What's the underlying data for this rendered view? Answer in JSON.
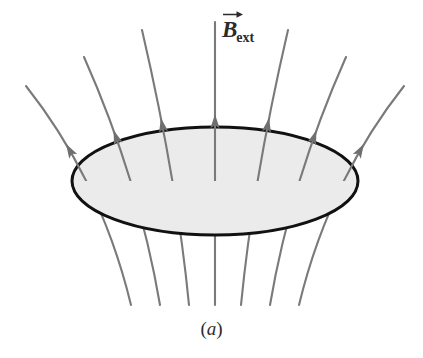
{
  "figure": {
    "caption": "(a)",
    "caption_letter": "a",
    "field_label": {
      "symbol": "B",
      "subscript": "ext",
      "full_text": "B_ext",
      "description": "external magnetic field vector"
    },
    "colors": {
      "background": "#ffffff",
      "line": "#7a7a7a",
      "arrowhead": "#6f6f6f",
      "surface_fill": "#ebebeb",
      "surface_stroke": "#111111",
      "text": "#2b2b2b"
    }
  },
  "diagram_data": {
    "type": "vector-field",
    "title": "Magnetic field lines passing upward through a tilted circular surface",
    "surface": {
      "name": "circular-loop-surface",
      "shape": "ellipse",
      "center_x": 215,
      "center_y": 181,
      "radius_x": 143,
      "radius_y": 54,
      "fill": "#ebebeb",
      "stroke": "#111111",
      "stroke_width": 3,
      "note": "represents a flat circular area viewed in perspective"
    },
    "field_direction": "upward",
    "line_count": 7,
    "arrowheads_shown": 7,
    "lines": [
      {
        "id": "line-1",
        "top_x": 26,
        "top_y": 86,
        "surface_x": 101,
        "bottom_x": 131,
        "bottom_y": 305,
        "arrow_t": 0.33,
        "splay": "far-left"
      },
      {
        "id": "line-2",
        "top_x": 84,
        "top_y": 57,
        "surface_x": 139,
        "bottom_x": 160,
        "bottom_y": 305,
        "arrow_t": 0.33,
        "splay": "left"
      },
      {
        "id": "line-3",
        "top_x": 142,
        "top_y": 30,
        "surface_x": 177,
        "bottom_x": 189,
        "bottom_y": 305,
        "arrow_t": 0.33,
        "splay": "near-left"
      },
      {
        "id": "line-4",
        "top_x": 215,
        "top_y": 22,
        "surface_x": 215,
        "bottom_x": 215,
        "bottom_y": 305,
        "arrow_t": 0.33,
        "splay": "center"
      },
      {
        "id": "line-5",
        "top_x": 288,
        "top_y": 30,
        "surface_x": 253,
        "bottom_x": 241,
        "bottom_y": 305,
        "arrow_t": 0.33,
        "splay": "near-right"
      },
      {
        "id": "line-6",
        "top_x": 346,
        "top_y": 57,
        "surface_x": 291,
        "bottom_x": 270,
        "bottom_y": 305,
        "arrow_t": 0.33,
        "splay": "right"
      },
      {
        "id": "line-7",
        "top_x": 404,
        "top_y": 86,
        "surface_x": 329,
        "bottom_x": 299,
        "bottom_y": 305,
        "arrow_t": 0.33,
        "splay": "far-right"
      }
    ]
  }
}
